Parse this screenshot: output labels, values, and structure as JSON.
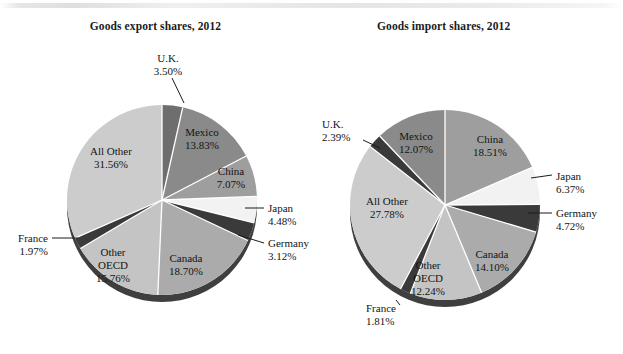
{
  "figure": {
    "background_color": "#ffffff",
    "panel_count": 2
  },
  "palette": {
    "light_gray": "#cccccc",
    "medium_gray": "#ababab",
    "mid_dark_gray": "#8a8a8a",
    "near_white": "#f2f2f2",
    "dark_charcoal": "#3a3a3a",
    "very_dark": "#2b2b2b",
    "shadow": "#2f2f2f",
    "separator": "#ffffff",
    "text": "#141414"
  },
  "chart_data": [
    {
      "type": "pie",
      "id": "goods-export-shares",
      "title": "Goods export shares, 2012",
      "center": [
        162,
        200
      ],
      "radius": 95,
      "start_angle_deg": -90,
      "direction": "clockwise",
      "legend": "none",
      "categories": [
        "U.K.",
        "Mexico",
        "China",
        "Japan",
        "Germany",
        "Canada",
        "Other OECD",
        "France",
        "All Other"
      ],
      "values": [
        3.5,
        13.83,
        7.07,
        4.48,
        3.12,
        18.7,
        15.76,
        1.97,
        31.56
      ],
      "value_labels": [
        "3.50%",
        "13.83%",
        "7.07%",
        "4.48%",
        "3.12%",
        "18.70%",
        "15.76%",
        "1.97%",
        "31.56%"
      ],
      "slices": [
        {
          "name": "U.K.",
          "value": 3.5,
          "value_label": "3.50%",
          "color": "#6e6e6e",
          "label_mode": "callout",
          "callout": {
            "x": 168,
            "y": 62,
            "anchor": "middle",
            "leader": [
              [
                172,
                78
              ],
              [
                184,
                103
              ]
            ]
          }
        },
        {
          "name": "Mexico",
          "value": 13.83,
          "value_label": "13.83%",
          "color": "#8a8a8a",
          "label_mode": "inside",
          "label_pos": [
            202,
            136
          ]
        },
        {
          "name": "China",
          "value": 7.07,
          "value_label": "7.07%",
          "color": "#9e9e9e",
          "label_mode": "inside",
          "label_pos": [
            231,
            175
          ]
        },
        {
          "name": "Japan",
          "value": 4.48,
          "value_label": "4.48%",
          "color": "#f2f2f2",
          "label_mode": "callout",
          "callout": {
            "x": 268,
            "y": 212,
            "anchor": "start",
            "leader": [
              [
                245,
                208
              ],
              [
                264,
                208
              ]
            ]
          }
        },
        {
          "name": "Germany",
          "value": 3.12,
          "value_label": "3.12%",
          "color": "#3a3a3a",
          "label_mode": "callout",
          "callout": {
            "x": 268,
            "y": 247,
            "anchor": "start",
            "leader": [
              [
                238,
                235
              ],
              [
                264,
                243
              ]
            ]
          }
        },
        {
          "name": "Canada",
          "value": 18.7,
          "value_label": "18.70%",
          "color": "#ababab",
          "label_mode": "inside",
          "label_pos": [
            186,
            262
          ]
        },
        {
          "name": "Other OECD",
          "value": 15.76,
          "value_label": "15.76%",
          "color": "#c4c4c4",
          "label_mode": "inside3",
          "label_pos": [
            113,
            256
          ]
        },
        {
          "name": "France",
          "value": 1.97,
          "value_label": "1.97%",
          "color": "#3a3a3a",
          "label_mode": "callout",
          "callout": {
            "x": 48,
            "y": 242,
            "anchor": "end",
            "leader": [
              [
                52,
                238
              ],
              [
                78,
                238
              ]
            ]
          }
        },
        {
          "name": "All Other",
          "value": 31.56,
          "value_label": "31.56%",
          "color": "#cccccc",
          "label_mode": "inside",
          "label_pos": [
            111,
            155
          ]
        }
      ]
    },
    {
      "type": "pie",
      "id": "goods-import-shares",
      "title": "Goods import shares, 2012",
      "center": [
        445,
        205
      ],
      "radius": 95,
      "start_angle_deg": -90,
      "direction": "clockwise",
      "legend": "none",
      "categories": [
        "China",
        "Japan",
        "Germany",
        "Canada",
        "Other OECD",
        "France",
        "All Other",
        "U.K.",
        "Mexico"
      ],
      "values": [
        18.51,
        6.37,
        4.72,
        14.1,
        12.24,
        1.81,
        27.78,
        2.39,
        12.07
      ],
      "value_labels": [
        "18.51%",
        "6.37%",
        "4.72%",
        "14.10%",
        "12.24%",
        "1.81%",
        "27.78%",
        "2.39%",
        "12.07%"
      ],
      "slices": [
        {
          "name": "China",
          "value": 18.51,
          "value_label": "18.51%",
          "color": "#9e9e9e",
          "label_mode": "inside",
          "label_pos": [
            490,
            143
          ]
        },
        {
          "name": "Japan",
          "value": 6.37,
          "value_label": "6.37%",
          "color": "#f2f2f2",
          "label_mode": "callout",
          "callout": {
            "x": 556,
            "y": 180,
            "anchor": "start",
            "leader": [
              [
                531,
                178
              ],
              [
                552,
                175
              ]
            ]
          }
        },
        {
          "name": "Germany",
          "value": 4.72,
          "value_label": "4.72%",
          "color": "#3a3a3a",
          "label_mode": "callout",
          "callout": {
            "x": 556,
            "y": 217,
            "anchor": "start",
            "leader": [
              [
                528,
                213
              ],
              [
                552,
                213
              ]
            ]
          }
        },
        {
          "name": "Canada",
          "value": 14.1,
          "value_label": "14.10%",
          "color": "#ababab",
          "label_mode": "inside",
          "label_pos": [
            492,
            258
          ]
        },
        {
          "name": "Other OECD",
          "value": 12.24,
          "value_label": "12.24%",
          "color": "#c4c4c4",
          "label_mode": "inside3",
          "label_pos": [
            428,
            269
          ]
        },
        {
          "name": "France",
          "value": 1.81,
          "value_label": "1.81%",
          "color": "#3a3a3a",
          "label_mode": "callout",
          "callout": {
            "x": 366,
            "y": 312,
            "anchor": "start",
            "leader": [
              [
                396,
                300
              ],
              [
                400,
                305
              ]
            ]
          }
        },
        {
          "name": "All Other",
          "value": 27.78,
          "value_label": "27.78%",
          "color": "#cccccc",
          "label_mode": "inside",
          "label_pos": [
            387,
            205
          ]
        },
        {
          "name": "U.K.",
          "value": 2.39,
          "value_label": "2.39%",
          "color": "#3a3a3a",
          "label_mode": "callout",
          "callout": {
            "x": 322,
            "y": 128,
            "anchor": "start",
            "leader": [
              [
                363,
                140
              ],
              [
                380,
                148
              ]
            ]
          }
        },
        {
          "name": "Mexico",
          "value": 12.07,
          "value_label": "12.07%",
          "color": "#8a8a8a",
          "label_mode": "inside",
          "label_pos": [
            416,
            140
          ]
        }
      ]
    }
  ]
}
